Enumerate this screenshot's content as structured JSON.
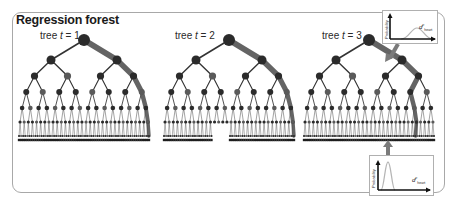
{
  "figure": {
    "title": "Regression forest",
    "trees": [
      {
        "label_prefix": "tree ",
        "var": "t",
        "label_suffix": " = 1",
        "x": 40,
        "y": 30,
        "root_x": 84
      },
      {
        "label_prefix": "tree ",
        "var": "t",
        "label_suffix": " = 2",
        "x": 175,
        "y": 30,
        "root_x": 229
      },
      {
        "label_prefix": "tree ",
        "var": "t",
        "label_suffix": " = 3",
        "x": 322,
        "y": 30,
        "root_x": 369
      }
    ],
    "insets": [
      {
        "name": "top-right-distribution",
        "ylabel": "Probability",
        "xlabel": "d",
        "xlabel_sup": "p",
        "xlabel_sub": "heart",
        "shape": "wide"
      },
      {
        "name": "bottom-distribution",
        "ylabel": "Probability",
        "xlabel": "d",
        "xlabel_sup": "p",
        "xlabel_sub": "heart",
        "shape": "narrow"
      }
    ],
    "colors": {
      "frame": "#a8a8a8",
      "node_dark": "#2b2b2b",
      "node_mid": "#5a5a5a",
      "edge_dark": "#333333",
      "path_highlight": "#4a4a4a",
      "arrow": "#7a7a7a",
      "curve": "#b5b5b5"
    }
  }
}
